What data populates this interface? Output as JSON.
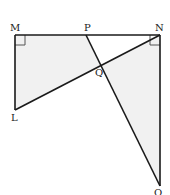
{
  "diagram": {
    "type": "geometry",
    "points": {
      "M": {
        "label": "M",
        "x": 15,
        "y": 35
      },
      "P": {
        "label": "P",
        "x": 86,
        "y": 35
      },
      "N": {
        "label": "N",
        "x": 160,
        "y": 35
      },
      "Q": {
        "label": "Q",
        "x": 101,
        "y": 65
      },
      "L": {
        "label": "L",
        "x": 15,
        "y": 110
      },
      "O": {
        "label": "O",
        "x": 160,
        "y": 186
      }
    },
    "segments": [
      "MN",
      "ML",
      "LN",
      "PO",
      "NO"
    ],
    "right_angles": [
      "M",
      "N"
    ],
    "shaded_regions": [
      "MPQL",
      "NQO"
    ],
    "colors": {
      "stroke": "#1a1a1a",
      "shade": "#f1f1f1",
      "right_angle_mark": "#555555"
    }
  }
}
